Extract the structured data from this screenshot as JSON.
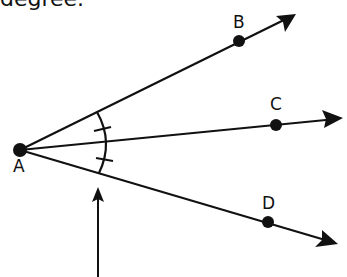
{
  "heading": {
    "text": "degree."
  },
  "diagram": {
    "vertex": {
      "label": "A",
      "x": 20,
      "y": 150
    },
    "rays": [
      {
        "label": "B",
        "point": {
          "x": 239,
          "y": 41
        },
        "tip": {
          "x": 296,
          "y": 14
        }
      },
      {
        "label": "C",
        "point": {
          "x": 276,
          "y": 125
        },
        "tip": {
          "x": 343,
          "y": 118
        }
      },
      {
        "label": "D",
        "point": {
          "x": 268,
          "y": 222
        },
        "tip": {
          "x": 338,
          "y": 244
        }
      }
    ],
    "congruence_marks": 2,
    "pointer_arrow": {
      "from": {
        "x": 98,
        "y": 277
      },
      "to": {
        "x": 98,
        "y": 188
      }
    },
    "stroke_color": "#111111"
  }
}
